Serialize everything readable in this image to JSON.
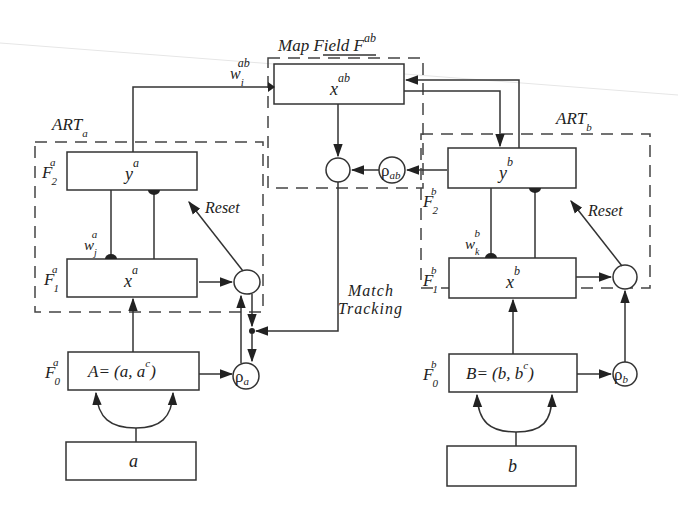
{
  "map_field": {
    "label": "Map Field F",
    "label_sup": "ab",
    "node": "x",
    "node_sup": "ab",
    "weight": "w",
    "weight_sub": "i",
    "weight_sup": "ab",
    "vigilance": "ρ",
    "vigilance_sub": "ab"
  },
  "art_a": {
    "title": "ART",
    "title_sub": "a",
    "f2_label": "F",
    "f2_sub": "2",
    "f2_sup": "a",
    "f2_node": "y",
    "f2_node_sup": "a",
    "f1_label": "F",
    "f1_sub": "1",
    "f1_sup": "a",
    "f1_node": "x",
    "f1_node_sup": "a",
    "f0_label": "F",
    "f0_sub": "0",
    "f0_sup": "a",
    "f0_node": "A=  (a, a",
    "f0_node_sup": "c",
    "f0_node_close": ")",
    "weight": "w",
    "weight_sub": "j",
    "weight_sup": "a",
    "reset": "Reset",
    "vigilance": "ρ",
    "vigilance_sub": "a",
    "input": "a"
  },
  "art_b": {
    "title": "ART",
    "title_sub": "b",
    "f2_label": "F",
    "f2_sub": "2",
    "f2_sup": "b",
    "f2_node": "y",
    "f2_node_sup": "b",
    "f1_label": "F",
    "f1_sub": "1",
    "f1_sup": "b",
    "f1_node": "x",
    "f1_node_sup": "b",
    "f0_label": "F",
    "f0_sub": "0",
    "f0_sup": "b",
    "f0_node": "B=  (b, b",
    "f0_node_sup": "c",
    "f0_node_close": ")",
    "weight": "w",
    "weight_sub": "k",
    "weight_sup": "b",
    "reset": "Reset",
    "vigilance": "ρ",
    "vigilance_sub": "b",
    "input": "b"
  },
  "match_tracking": {
    "line1": "Match",
    "line2": "Tracking"
  },
  "colors": {
    "stroke": "#333333",
    "background": "#ffffff"
  }
}
